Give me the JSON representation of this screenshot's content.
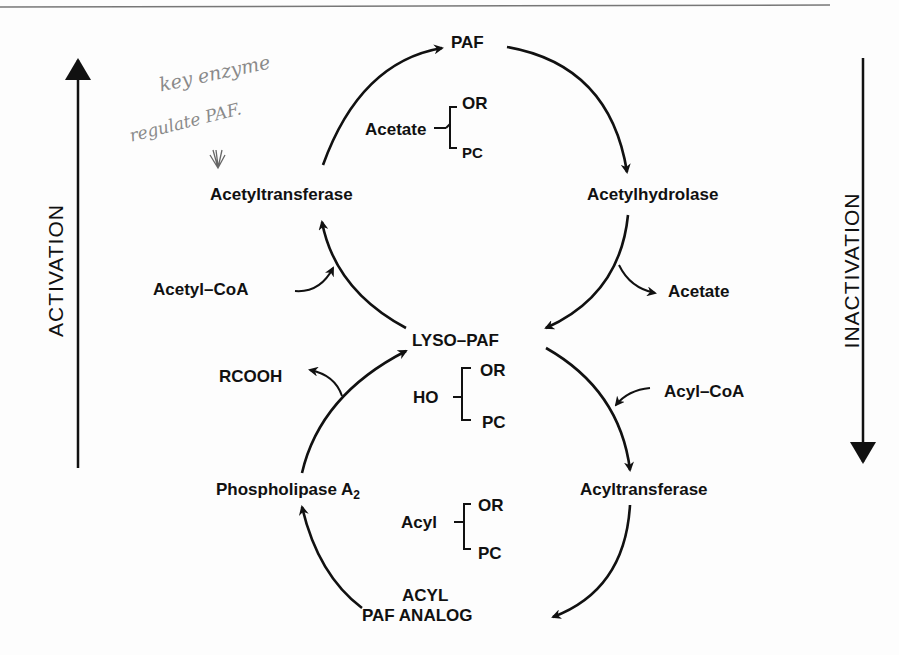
{
  "diagram": {
    "side_labels": {
      "left": "ACTIVATION",
      "right": "INACTIVATION"
    },
    "nodes": {
      "paf": "PAF",
      "lyso_paf": "LYSO–PAF",
      "acyl_paf_line1": "ACYL",
      "acyl_paf_line2": "PAF ANALOG"
    },
    "enzymes": {
      "acetyltransferase": "Acetyltransferase",
      "acetylhydrolase": "Acetylhydrolase",
      "phospholipase": "Phospholipase A",
      "phospholipase_sub": "2",
      "acyltransferase": "Acyltransferase"
    },
    "cofactors": {
      "acetyl_coa": "Acetyl–CoA",
      "acetate_out": "Acetate",
      "rcooh": "RCOOH",
      "acyl_coa": "Acyl–CoA"
    },
    "structures": [
      {
        "group": "Acetate",
        "top": "OR",
        "bottom": "PC"
      },
      {
        "group": "HO",
        "top": "OR",
        "bottom": "PC"
      },
      {
        "group": "Acyl",
        "top": "OR",
        "bottom": "PC"
      }
    ],
    "handwriting": {
      "line1": "key enzyme",
      "line2": "regulate PAF."
    }
  }
}
